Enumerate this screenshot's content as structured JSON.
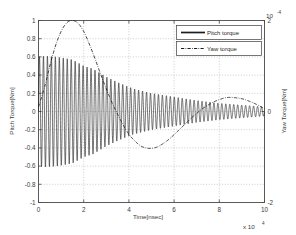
{
  "chart_data": {
    "type": "line",
    "title": "",
    "xlabel": "Time[nsec]",
    "ylabel_left": "Pitch Torque[Nm]",
    "ylabel_right": "Yaw Torque[Nm]",
    "x_exponent_label": "x 10",
    "x_exponent_power": "4",
    "y_right_exponent_label": "10",
    "y_right_exponent_power": "-4",
    "grid": true,
    "legend_position": "top-right",
    "xlim": [
      0,
      10
    ],
    "xticks": [
      "0",
      "2",
      "4",
      "6",
      "8",
      "10"
    ],
    "ylim_left": [
      -1,
      1
    ],
    "yticks_left": [
      "1",
      "0.8",
      "0.6",
      "0.4",
      "0.2",
      "0",
      "-0.2",
      "-0.4",
      "-0.6",
      "-0.8",
      "-1"
    ],
    "ylim_right": [
      -2,
      2
    ],
    "yticks_right": [
      "2",
      "0",
      "-2"
    ],
    "series": [
      {
        "name": "Pitch torque",
        "style": "solid",
        "axis": "left",
        "description": "Damped high-frequency oscillation starting near +/-0.6 amplitude, decaying toward zero by the end of the record",
        "envelope_x": [
          0,
          0.3,
          0.8,
          1.5,
          2.0,
          2.4,
          3.0,
          3.6,
          4.2,
          5.0,
          6.0,
          7.0,
          8.0,
          9.0,
          10.0
        ],
        "envelope_amplitude": [
          0.6,
          0.61,
          0.6,
          0.57,
          0.5,
          0.47,
          0.38,
          0.31,
          0.25,
          0.2,
          0.16,
          0.12,
          0.09,
          0.07,
          0.05
        ],
        "oscillation_cycles": 57
      },
      {
        "name": "Yaw torque",
        "style": "dash-dot",
        "axis": "right",
        "description": "Slow large-amplitude swing: rises to a peak near x=1.5, falls to a trough near x=5, recovers to a smaller hump near x=8.3",
        "x": [
          0,
          0.25,
          0.5,
          0.75,
          1.0,
          1.25,
          1.5,
          1.75,
          2.0,
          2.25,
          2.5,
          2.75,
          3.0,
          3.25,
          3.5,
          3.75,
          4.0,
          4.25,
          4.5,
          4.75,
          5.0,
          5.25,
          5.5,
          5.75,
          6.0,
          6.25,
          6.5,
          6.75,
          7.0,
          7.25,
          7.5,
          7.75,
          8.0,
          8.25,
          8.5,
          8.75,
          9.0,
          9.25,
          9.5,
          9.75,
          10.0
        ],
        "y_left_scale": [
          0.05,
          0.25,
          0.5,
          0.72,
          0.88,
          0.975,
          1.0,
          0.97,
          0.88,
          0.74,
          0.58,
          0.41,
          0.25,
          0.1,
          -0.03,
          -0.15,
          -0.25,
          -0.32,
          -0.375,
          -0.4,
          -0.405,
          -0.39,
          -0.355,
          -0.31,
          -0.255,
          -0.195,
          -0.135,
          -0.075,
          -0.02,
          0.03,
          0.07,
          0.105,
          0.13,
          0.15,
          0.155,
          0.15,
          0.14,
          0.12,
          0.095,
          0.065,
          0.03
        ]
      }
    ],
    "legend_entries": [
      {
        "label": "Pitch torque",
        "style": "solid"
      },
      {
        "label": "Yaw torque",
        "style": "dash-dot"
      }
    ]
  }
}
